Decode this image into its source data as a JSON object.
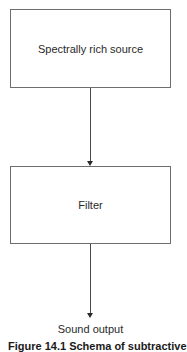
{
  "diagram": {
    "nodes": [
      {
        "id": "source",
        "label": "Spectrally rich source"
      },
      {
        "id": "filter",
        "label": "Filter"
      }
    ],
    "edges": [
      {
        "from": "source",
        "to": "filter"
      },
      {
        "from": "filter",
        "to": "output"
      }
    ],
    "output_label": "Sound output",
    "caption": "Figure 14.1 Schema of subtractive"
  }
}
